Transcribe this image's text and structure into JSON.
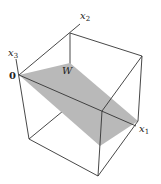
{
  "figure": {
    "type": "3d-box-with-plane",
    "plane_label": "W",
    "origin_label": "0",
    "axes": [
      {
        "name": "x1",
        "label": "x",
        "subscript": "1"
      },
      {
        "name": "x2",
        "label": "x",
        "subscript": "2"
      },
      {
        "name": "x3",
        "label": "x",
        "subscript": "3"
      }
    ],
    "colors": {
      "plane": "#b9b9b9",
      "edges": "#333333",
      "background": "#ffffff"
    }
  }
}
